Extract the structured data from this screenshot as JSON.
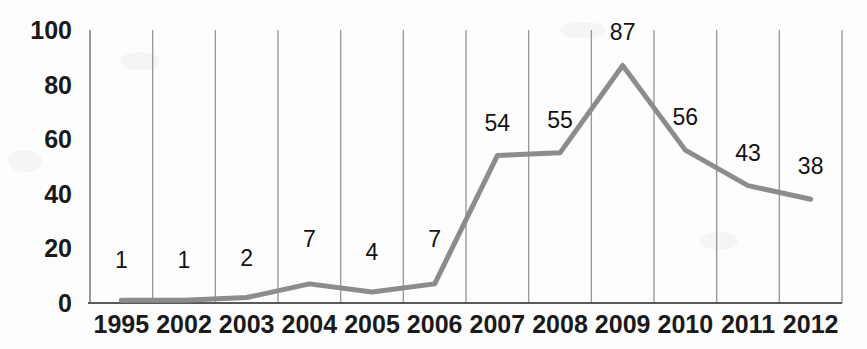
{
  "chart_data": {
    "type": "line",
    "title": "",
    "subtitle": "",
    "xlabel": "",
    "ylabel": "",
    "categories": [
      "1995",
      "2002",
      "2003",
      "2004",
      "2005",
      "2006",
      "2007",
      "2008",
      "2009",
      "2010",
      "2011",
      "2012"
    ],
    "values": [
      1,
      1,
      2,
      7,
      4,
      7,
      54,
      55,
      87,
      56,
      43,
      38
    ],
    "data_labels": [
      "1",
      "1",
      "2",
      "7",
      "4",
      "7",
      "54",
      "55",
      "87",
      "56",
      "43",
      "38"
    ],
    "series": [
      {
        "name": "",
        "values": [
          1,
          1,
          2,
          7,
          4,
          7,
          54,
          55,
          87,
          56,
          43,
          38
        ]
      }
    ],
    "ylim": [
      0,
      100
    ],
    "y_ticks": [
      "0",
      "20",
      "40",
      "60",
      "80",
      "100"
    ],
    "y_tick_values": [
      0,
      20,
      40,
      60,
      80,
      100
    ],
    "grid": "vertical",
    "legend": "none",
    "line_color": "#8c8c8c",
    "text_color": "#1a1a1a",
    "grid_color": "#9a9a9a",
    "axis_color": "#595959",
    "background": "#ffffff"
  },
  "axis": {
    "y_title": "",
    "x_title": ""
  }
}
